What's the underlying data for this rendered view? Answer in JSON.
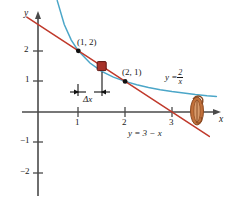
{
  "figure": {
    "axes": {
      "x_axis_label": "x",
      "y_axis_label": "y",
      "x_ticks": [
        {
          "value": 1,
          "label": "1"
        },
        {
          "value": 2,
          "label": "2"
        },
        {
          "value": 3,
          "label": "3"
        }
      ],
      "y_ticks": [
        {
          "value": 2,
          "label": "2"
        },
        {
          "value": 1,
          "label": "1"
        },
        {
          "value": -1,
          "label": "−1"
        },
        {
          "value": -2,
          "label": "−2"
        }
      ]
    },
    "annotations": {
      "point_1": "(1, 2)",
      "point_2": "(2, 1)",
      "delta_x": "Δx",
      "curve_equation_lhs": "y =",
      "curve_equation_num": "2",
      "curve_equation_den": "x",
      "line_equation": "y = 3 − x"
    },
    "colors": {
      "curve": "#4ba6c8",
      "line": "#c0392b",
      "axis": "#4a4a4a",
      "point": "#111111",
      "marker_fill": "#a8332a",
      "marker_stroke": "#5d1410",
      "smudge": "#c2703a",
      "background": "#ffffff"
    },
    "chart_data": {
      "type": "line",
      "title": "",
      "xlabel": "x",
      "ylabel": "y",
      "xlim": [
        -0.3,
        4.3
      ],
      "ylim": [
        -2.4,
        3.1
      ],
      "grid": false,
      "legend": "inline-labels",
      "series": [
        {
          "name": "y = 2/x",
          "color": "#4ba6c8",
          "x": [
            0.55,
            0.7,
            0.85,
            1.0,
            1.25,
            1.5,
            1.75,
            2.0,
            2.25,
            2.5,
            2.75,
            3.0,
            3.25,
            3.5,
            3.75,
            3.95
          ],
          "y": [
            3.64,
            2.86,
            2.35,
            2.0,
            1.6,
            1.33,
            1.14,
            1.0,
            0.89,
            0.8,
            0.73,
            0.67,
            0.62,
            0.57,
            0.53,
            0.51
          ]
        },
        {
          "name": "y = 3 - x",
          "color": "#c0392b",
          "x": [
            -0.1,
            3.8
          ],
          "y": [
            3.1,
            -0.8
          ]
        }
      ],
      "points": [
        {
          "label": "(1, 2)",
          "x": 1,
          "y": 2
        },
        {
          "label": "(2, 1)",
          "x": 2,
          "y": 1
        }
      ],
      "markers": [
        {
          "label": "secant-midpoint-marker",
          "x": 1.5,
          "y": 1.5,
          "shape": "square",
          "color": "#a8332a"
        }
      ],
      "annotations": [
        {
          "text": "Δx",
          "x": 1.5,
          "y": 0.72,
          "type": "measure-bracket",
          "from_x": 1.0,
          "to_x": 1.5
        }
      ]
    }
  }
}
